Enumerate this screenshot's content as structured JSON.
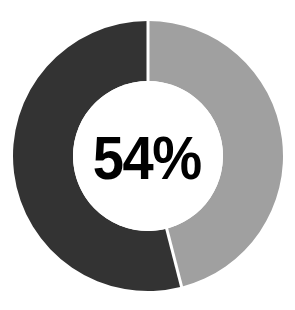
{
  "chart_data": {
    "type": "pie",
    "variant": "donut",
    "title": "",
    "subtitle": "",
    "xlabel": "",
    "ylabel": "",
    "center_label": "54%",
    "value_unit": "%",
    "total": 100,
    "grid": false,
    "legend": false,
    "legend_position": "none",
    "start_angle_deg": 0,
    "direction": "counterclockwise",
    "categories": [
      "Completed",
      "Remaining"
    ],
    "values": [
      54,
      46
    ],
    "slices": [
      {
        "label": "Completed",
        "value": 54,
        "percent": 54,
        "color": "#333333",
        "sweep_deg": 194.4,
        "side": "left"
      },
      {
        "label": "Remaining",
        "value": 46,
        "percent": 46,
        "color": "#a0a0a0",
        "sweep_deg": 165.6,
        "side": "right"
      }
    ],
    "colors": [
      "#333333",
      "#a0a0a0"
    ],
    "background_color": "#ffffff",
    "separator_color": "#ffffff",
    "label_color": "#000000",
    "geometry": {
      "center_x": 148,
      "center_y": 156,
      "outer_radius": 135,
      "inner_radius": 75
    }
  },
  "labels": {
    "center_value": "54%"
  }
}
